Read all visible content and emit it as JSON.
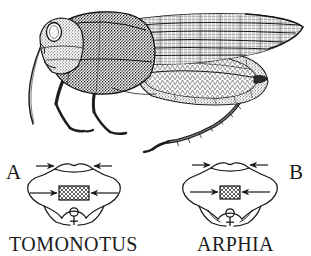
{
  "plate": {
    "background_color": "#ffffff",
    "ink_color": "#1a1a1a"
  },
  "habitus": {
    "caption": "",
    "subject": "grasshopper-lateral-view",
    "parts": [
      "head",
      "compound-eye",
      "antenna",
      "pronotum",
      "tegmen",
      "hind-femur",
      "hind-tibia",
      "fore-leg",
      "mid-leg",
      "abdomen"
    ]
  },
  "comparison": {
    "panels": [
      {
        "letter": "A",
        "taxon": "TOMONOTUS",
        "sex_symbol": "♀",
        "arrow_count": 4,
        "hatch_width": "wide"
      },
      {
        "letter": "B",
        "taxon": "ARPHIA",
        "sex_symbol": "♀",
        "arrow_count": 4,
        "hatch_width": "narrow"
      }
    ]
  }
}
